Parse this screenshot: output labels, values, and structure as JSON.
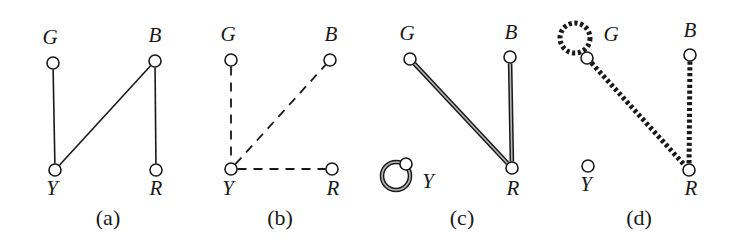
{
  "figure": {
    "width": 737,
    "height": 250,
    "background_color": "#ffffff",
    "ink_color": "#191919"
  },
  "panels": [
    {
      "id": "a",
      "caption": "(a)",
      "caption_pos": {
        "x": 108,
        "y": 229
      },
      "edge_style": "solid-thin",
      "nodes": [
        {
          "id": "G",
          "label": "G",
          "x": 53,
          "y": 63,
          "r": 6,
          "label_x": 50,
          "label_y": 48
        },
        {
          "id": "B",
          "label": "B",
          "x": 155,
          "y": 61,
          "r": 6,
          "label_x": 155,
          "label_y": 46
        },
        {
          "id": "Y",
          "label": "Y",
          "x": 55,
          "y": 170,
          "r": 6,
          "label_x": 52,
          "label_y": 199
        },
        {
          "id": "R",
          "label": "R",
          "x": 156,
          "y": 170,
          "r": 6,
          "label_x": 156,
          "label_y": 199
        }
      ],
      "edges": [
        {
          "from": "G",
          "to": "Y"
        },
        {
          "from": "Y",
          "to": "B"
        },
        {
          "from": "B",
          "to": "R"
        }
      ],
      "self_loops": []
    },
    {
      "id": "b",
      "caption": "(b)",
      "caption_pos": {
        "x": 280,
        "y": 229
      },
      "edge_style": "dashed-thin",
      "nodes": [
        {
          "id": "G",
          "label": "G",
          "x": 231,
          "y": 60,
          "r": 6,
          "label_x": 228,
          "label_y": 45
        },
        {
          "id": "B",
          "label": "B",
          "x": 330,
          "y": 60,
          "r": 6,
          "label_x": 331,
          "label_y": 45
        },
        {
          "id": "Y",
          "label": "Y",
          "x": 231,
          "y": 169,
          "r": 6,
          "label_x": 228,
          "label_y": 199
        },
        {
          "id": "R",
          "label": "R",
          "x": 332,
          "y": 169,
          "r": 6,
          "label_x": 333,
          "label_y": 199
        }
      ],
      "edges": [
        {
          "from": "G",
          "to": "Y"
        },
        {
          "from": "Y",
          "to": "B"
        },
        {
          "from": "Y",
          "to": "R"
        }
      ],
      "self_loops": []
    },
    {
      "id": "c",
      "caption": "(c)",
      "caption_pos": {
        "x": 462,
        "y": 229
      },
      "edge_style": "solid-thick-double",
      "nodes": [
        {
          "id": "G",
          "label": "G",
          "x": 410,
          "y": 59,
          "r": 6,
          "label_x": 407,
          "label_y": 44
        },
        {
          "id": "B",
          "label": "B",
          "x": 510,
          "y": 57,
          "r": 6,
          "label_x": 511,
          "label_y": 43
        },
        {
          "id": "Y",
          "label": "Y",
          "x": 406,
          "y": 164,
          "r": 6,
          "label_x": 428,
          "label_y": 192
        },
        {
          "id": "R",
          "label": "R",
          "x": 512,
          "y": 168,
          "r": 6,
          "label_x": 513,
          "label_y": 199
        }
      ],
      "edges": [
        {
          "from": "G",
          "to": "R"
        },
        {
          "from": "B",
          "to": "R"
        }
      ],
      "self_loops": [
        {
          "at": "Y",
          "cx": 396,
          "cy": 176,
          "r": 14
        }
      ]
    },
    {
      "id": "d",
      "caption": "(d)",
      "caption_pos": {
        "x": 639,
        "y": 229
      },
      "edge_style": "dotted-thick",
      "nodes": [
        {
          "id": "G",
          "label": "G",
          "x": 587,
          "y": 58,
          "r": 6,
          "label_x": 611,
          "label_y": 45
        },
        {
          "id": "B",
          "label": "B",
          "x": 690,
          "y": 55,
          "r": 6,
          "label_x": 690,
          "label_y": 41
        },
        {
          "id": "Y",
          "label": "Y",
          "x": 588,
          "y": 166,
          "r": 6,
          "label_x": 586,
          "label_y": 195
        },
        {
          "id": "R",
          "label": "R",
          "x": 689,
          "y": 170,
          "r": 6,
          "label_x": 691,
          "label_y": 199
        }
      ],
      "edges": [
        {
          "from": "G",
          "to": "R"
        },
        {
          "from": "B",
          "to": "R"
        }
      ],
      "self_loops": [
        {
          "at": "G",
          "cx": 575,
          "cy": 38,
          "r": 15
        }
      ]
    }
  ]
}
